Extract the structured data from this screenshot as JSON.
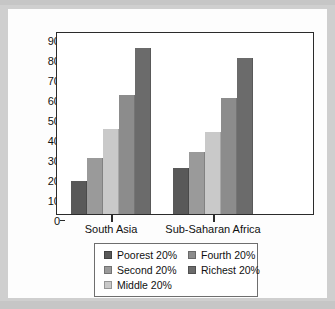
{
  "chart_data": {
    "type": "bar",
    "title": "",
    "xlabel": "",
    "ylabel": "",
    "categories": [
      "South Asia",
      "Sub-Saharan Africa"
    ],
    "series": [
      {
        "name": "Poorest 20%",
        "values": [
          16.5,
          23
        ],
        "color": "#595959"
      },
      {
        "name": "Second 20%",
        "values": [
          28,
          31
        ],
        "color": "#9a9a9a"
      },
      {
        "name": "Middle 20%",
        "values": [
          42.5,
          41
        ],
        "color": "#c9c9c9"
      },
      {
        "name": "Fourth 20%",
        "values": [
          59.5,
          58
        ],
        "color": "#8c8c8c"
      },
      {
        "name": "Richest 20%",
        "values": [
          83,
          78
        ],
        "color": "#6b6b6b"
      }
    ],
    "ylim": [
      0,
      90
    ],
    "yticks": [
      0,
      10,
      20,
      30,
      40,
      50,
      60,
      70,
      80,
      90
    ],
    "ytick_labels": [
      "0",
      "10",
      "20",
      "30",
      "40",
      "50",
      "60",
      "70",
      "80",
      "90"
    ],
    "grid": false,
    "legend_position": "bottom",
    "legend_columns": 2
  },
  "axis": {
    "y_labels": [
      "90",
      "80",
      "70",
      "60",
      "50",
      "40",
      "30",
      "20",
      "10",
      "0"
    ],
    "x_labels": [
      "South Asia",
      "Sub-Saharan Africa"
    ]
  },
  "legend": {
    "entries": [
      {
        "label": "Poorest 20%",
        "color": "#595959"
      },
      {
        "label": "Fourth 20%",
        "color": "#8c8c8c"
      },
      {
        "label": "Second 20%",
        "color": "#9a9a9a"
      },
      {
        "label": "Richest 20%",
        "color": "#6b6b6b"
      },
      {
        "label": "Middle 20%",
        "color": "#c9c9c9"
      }
    ]
  },
  "colors": {
    "page_background": "#cfcfcf",
    "card_background": "#fdfdfd",
    "axis_line": "#2b2b2b",
    "legend_border": "#6e6e6e",
    "text": "#111111"
  }
}
